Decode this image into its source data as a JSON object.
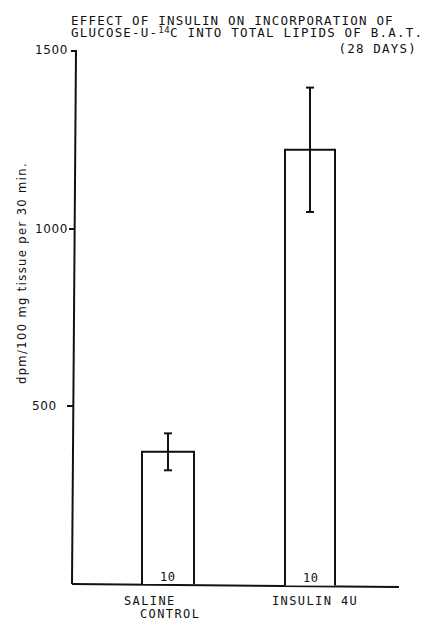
{
  "chart_data": {
    "type": "bar",
    "title_lines": {
      "line1": "EFFECT OF INSULIN ON INCORPORATION OF",
      "line2_pre": "GLUCOSE-U-",
      "line2_sup": "14",
      "line2_post": "C INTO TOTAL LIPIDS OF B.A.T.",
      "line3": "(28 DAYS)"
    },
    "xlabel": "",
    "ylabel": "dpm/100 mg tissue per 30 min.",
    "ylim": [
      0,
      1500
    ],
    "yticks": [
      500,
      1000,
      1500
    ],
    "ytick_labels": [
      "500",
      "1000",
      "1500"
    ],
    "categories": [
      "SALINE CONTROL",
      "INSULIN 4U"
    ],
    "category_label_lines": [
      [
        "SALINE",
        "CONTROL"
      ],
      [
        "INSULIN 4U"
      ]
    ],
    "values": [
      372,
      1222
    ],
    "error": [
      52,
      175
    ],
    "n": [
      "10",
      "10"
    ],
    "grid": false,
    "legend": null,
    "bar_fill": "#ffffff",
    "line_color": "#111111"
  }
}
